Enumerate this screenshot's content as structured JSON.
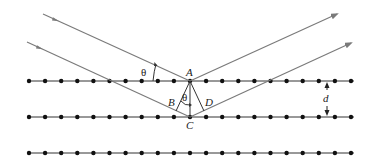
{
  "diagram": {
    "labels": {
      "A": "A",
      "B": "B",
      "C": "C",
      "D": "D",
      "d": "d",
      "theta_incident": "θ",
      "theta_inner": "θ"
    },
    "colors": {
      "ray": "#7a7a7a",
      "lattice_line": "#333333",
      "atom": "#111111",
      "text": "#222222"
    },
    "lattice": {
      "rows_y": [
        81,
        117,
        153
      ],
      "x_start": 29,
      "x_end": 352,
      "atom_spacing": 16.1,
      "atoms_per_row": 21
    },
    "rays": {
      "incident_upper": {
        "from": [
          43,
          14
        ],
        "to": [
          190,
          81
        ]
      },
      "incident_lower": {
        "from": [
          27,
          42
        ],
        "to": [
          190,
          117
        ]
      },
      "reflected_upper": {
        "from": [
          190,
          81
        ],
        "to": [
          337,
          14
        ]
      },
      "reflected_lower": {
        "from": [
          190,
          117
        ],
        "to": [
          351,
          43
        ]
      }
    },
    "points": {
      "A": [
        190,
        81
      ],
      "B": [
        176,
        111
      ],
      "C": [
        190,
        117
      ],
      "D": [
        204,
        111
      ]
    }
  }
}
